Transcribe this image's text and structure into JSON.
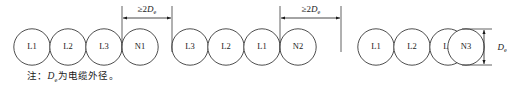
{
  "figure": {
    "type": "cable-arrangement-diagram",
    "note": {
      "prefix": "注：",
      "symbol": "D",
      "subscript": "e",
      "suffix": "为电缆外径。",
      "full_text": "注：De为电缆外径。"
    },
    "groups": [
      {
        "id": "group-1",
        "cables": [
          "L1",
          "L2",
          "L3",
          "N1"
        ]
      },
      {
        "id": "group-2",
        "cables": [
          "L3",
          "L2",
          "L1",
          "N2"
        ]
      },
      {
        "id": "group-3",
        "cables": [
          "L1",
          "L2",
          "L3",
          "N3"
        ]
      }
    ],
    "dimensions": [
      {
        "id": "gap-1",
        "orientation": "horizontal",
        "relation": "≥",
        "factor": "2",
        "symbol": "D",
        "subscript": "e",
        "label": "≥2De"
      },
      {
        "id": "gap-2",
        "orientation": "horizontal",
        "relation": "≥",
        "factor": "2",
        "symbol": "D",
        "subscript": "e",
        "label": "≥2De"
      },
      {
        "id": "outer-diameter",
        "orientation": "vertical",
        "relation": "",
        "factor": "",
        "symbol": "D",
        "subscript": "e",
        "label": "De"
      }
    ],
    "colors": {
      "stroke": "#3a3a3a",
      "dimension": "#1a1a1a",
      "text": "#1a1a1a",
      "background": "#ffffff"
    }
  }
}
